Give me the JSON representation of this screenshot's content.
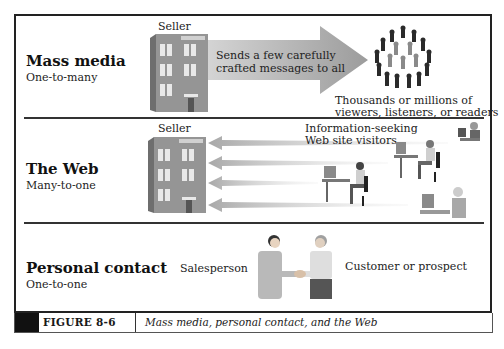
{
  "figure": {
    "label": "FIGURE 8-6",
    "caption": "Mass media, personal contact, and the Web"
  },
  "rows": [
    {
      "title": "Mass media",
      "subtitle": "One-to-many",
      "seller_label": "Seller",
      "arrow_text_line1": "Sends a few carefully",
      "arrow_text_line2": "crafted messages to all",
      "audience_line1": "Thousands or millions of",
      "audience_line2": "viewers, listeners, or readers"
    },
    {
      "title": "The Web",
      "subtitle": "Many-to-one",
      "seller_label": "Seller",
      "visitors_line1": "Information-seeking",
      "visitors_line2": "Web site visitors"
    },
    {
      "title": "Personal contact",
      "subtitle": "One-to-one",
      "salesperson_label": "Salesperson",
      "customer_label": "Customer or prospect"
    }
  ],
  "colors": {
    "frame": "#222222",
    "arrow": "#b8b8b8",
    "building": "#8f8f8f",
    "caption_block": "#111111"
  },
  "icons": [
    "building-icon",
    "crowd-icon",
    "computer-user-icon",
    "handshake-icon",
    "arrow-right-icon",
    "arrow-left-icon"
  ]
}
